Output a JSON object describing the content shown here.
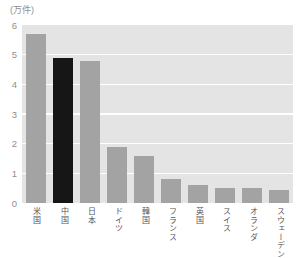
{
  "colors": {
    "page_bg": "#ffffff",
    "plot_bg": "#e4e4e4",
    "gridline": "#ffffff",
    "bar_default": "#a3a3a3",
    "bar_highlight": "#161616",
    "y_tick_text": "#8f8f8f",
    "x_label_text": "#555555"
  },
  "chart_data": {
    "type": "bar",
    "title": "",
    "unit_label": "(万件)",
    "categories": [
      "米国",
      "中国",
      "日本",
      "ドイツ",
      "韓国",
      "フランス",
      "英国",
      "スイス",
      "オランダ",
      "スウェーデン"
    ],
    "values": [
      5.7,
      4.9,
      4.8,
      1.9,
      1.6,
      0.8,
      0.6,
      0.5,
      0.5,
      0.45
    ],
    "highlight_index": 1,
    "highlighted_category": "中国",
    "xlabel": "",
    "ylabel": "万件",
    "ylim": [
      0,
      6
    ],
    "yticks": [
      0,
      1,
      2,
      3,
      4,
      5,
      6
    ],
    "grid": true,
    "gridlines_at": [
      1,
      2,
      3,
      4,
      5
    ],
    "legend": false,
    "x_label_orientation": "vertical"
  }
}
